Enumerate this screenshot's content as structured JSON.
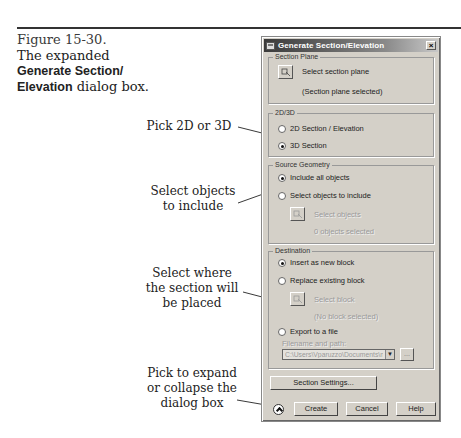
{
  "caption": {
    "figure_number": "Figure 15-30.",
    "line1": "The expanded",
    "bold1": "Generate Section/",
    "bold2": "Elevation",
    "tail": " dialog box."
  },
  "annotations": [
    {
      "text_lines": [
        "Pick 2D or 3D"
      ]
    },
    {
      "text_lines": [
        "Select objects",
        "to include"
      ]
    },
    {
      "text_lines": [
        "Select where",
        "the section will",
        "be placed"
      ]
    },
    {
      "text_lines": [
        "Pick to expand",
        "or collapse the",
        "dialog box"
      ]
    }
  ],
  "dialog": {
    "title": "Generate Section/Elevation",
    "close_label": "×",
    "section_plane": {
      "legend": "Section Plane",
      "select_label": "Select section plane",
      "status": "(Section plane selected)"
    },
    "mode": {
      "legend": "2D/3D",
      "options": [
        {
          "label": "2D Section / Elevation",
          "accel": "2",
          "selected": false
        },
        {
          "label": "3D Section",
          "accel": "3",
          "selected": true
        }
      ]
    },
    "source_geometry": {
      "legend": "Source Geometry",
      "options": [
        {
          "label": "Include all objects",
          "selected": true
        },
        {
          "label": "Select objects to include",
          "selected": false
        }
      ],
      "select_label": "Select objects",
      "status": "0 objects selected"
    },
    "destination": {
      "legend": "Destination",
      "options": [
        {
          "label": "Insert as new block",
          "selected": true
        },
        {
          "label": "Replace existing block",
          "selected": false
        },
        {
          "label": "Export to a file",
          "selected": false
        }
      ],
      "select_block_label": "Select block",
      "block_status": "(No block selected)",
      "filename_label": "Filename and path:",
      "filename_value": "C:\\Users\\Vparuzzo\\Documents\\new",
      "browse_label": "..."
    },
    "buttons": {
      "section_settings": "Section Settings...",
      "create": "Create",
      "cancel": "Cancel",
      "help": "Help"
    }
  },
  "colors": {
    "dialog_bg": "#d4d0c8",
    "titlebar_start": "#3a3a3a",
    "titlebar_end": "#c8c8c8"
  }
}
